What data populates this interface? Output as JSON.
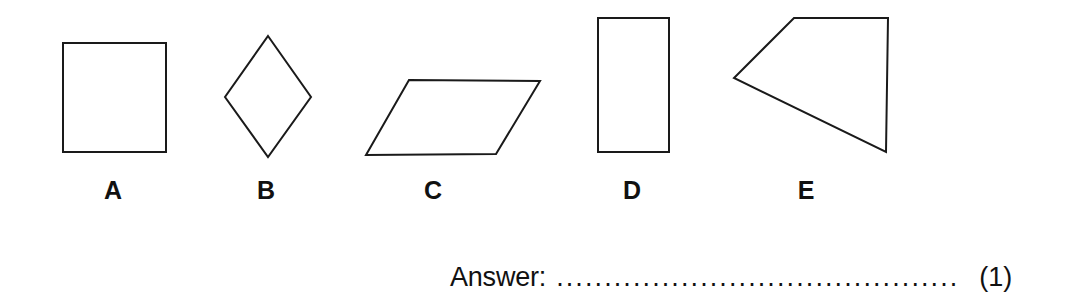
{
  "page": {
    "background_color": "#ffffff",
    "ink_color": "#1a1a1a"
  },
  "question": {
    "shapes": [
      {
        "label": "A",
        "name": "square",
        "points": "63,43 166,43 166,152 63,152"
      },
      {
        "label": "B",
        "name": "rhombus-diamond",
        "points": "268,36 311,97 268,157 225,97"
      },
      {
        "label": "C",
        "name": "parallelogram",
        "points": "409,80 540,81 496,154 366,155"
      },
      {
        "label": "D",
        "name": "rectangle",
        "points": "598,18 669,18 669,152 598,152"
      },
      {
        "label": "E",
        "name": "irregular-quadrilateral-kite",
        "points": "794,18 888,18 886,152 734,78"
      }
    ],
    "stroke_width": 2,
    "stroke_color": "#1a1a1a",
    "fill_color": "#ffffff"
  },
  "answer": {
    "label": "Answer:",
    "dots": "....................................................",
    "value": "",
    "marks": "(1)"
  }
}
